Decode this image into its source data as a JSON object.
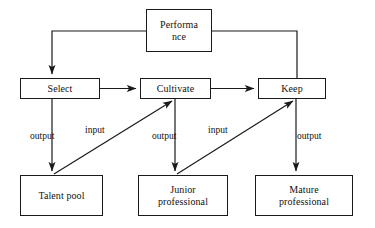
{
  "diagram": {
    "stroke_color": "#1a1a1a",
    "text_color": "#111111",
    "background_color": "#ffffff",
    "nodes": {
      "performance": {
        "line1": "Performa",
        "line2": "nce",
        "text": "Performance"
      },
      "select": {
        "text": "Select"
      },
      "cultivate": {
        "text": "Cultivate"
      },
      "keep": {
        "text": "Keep"
      },
      "talent_pool": {
        "text": "Talent pool"
      },
      "junior_professional": {
        "line1": "Junior",
        "line2": "professional",
        "text": "Junior professional"
      },
      "mature_professional": {
        "line1": "Mature",
        "line2": "professional",
        "text": "Mature professional"
      }
    },
    "edge_labels": {
      "output_select": "output",
      "input_cultivate": "input",
      "output_cultivate": "output",
      "input_keep": "input",
      "output_keep": "output"
    },
    "edges": [
      {
        "from": "performance",
        "to": "select",
        "label": ""
      },
      {
        "from": "performance",
        "to": "keep",
        "label": ""
      },
      {
        "from": "select",
        "to": "cultivate",
        "label": ""
      },
      {
        "from": "cultivate",
        "to": "keep",
        "label": ""
      },
      {
        "from": "select",
        "to": "talent_pool",
        "label": "output"
      },
      {
        "from": "cultivate",
        "to": "junior_professional",
        "label": "output"
      },
      {
        "from": "keep",
        "to": "mature_professional",
        "label": "output"
      },
      {
        "from": "talent_pool",
        "to": "cultivate",
        "label": "input"
      },
      {
        "from": "junior_professional",
        "to": "keep",
        "label": "input"
      }
    ]
  }
}
